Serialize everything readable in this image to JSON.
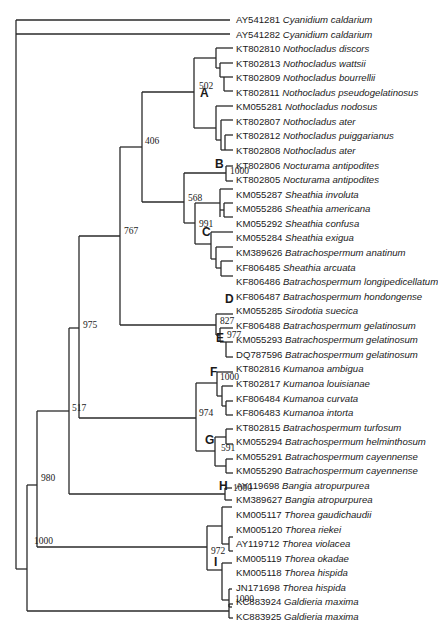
{
  "figure": {
    "type": "phylogenetic-tree",
    "leaf_start_y": 20,
    "leaf_spacing": 14.56,
    "leaf_x": 236
  },
  "leaves": [
    {
      "acc": "AY541281",
      "species": "Cyanidium caldarium",
      "tip_x": 236
    },
    {
      "acc": "AY541282",
      "species": "Cyanidium caldarium",
      "tip_x": 236
    },
    {
      "acc": "KT802810",
      "species": "Nothocladus discors",
      "tip_x": 236
    },
    {
      "acc": "KT802813",
      "species": "Nothocladus wattsii",
      "tip_x": 236
    },
    {
      "acc": "KT802809",
      "species": "Nothocladus bourrellii",
      "tip_x": 236
    },
    {
      "acc": "KT802811",
      "species": "Nothocladus pseudogelatinosus",
      "tip_x": 236
    },
    {
      "acc": "KM055281",
      "species": "Nothocladus nodosus",
      "tip_x": 236
    },
    {
      "acc": "KT802807",
      "species": "Nothocladus ater",
      "tip_x": 236
    },
    {
      "acc": "KT802812",
      "species": "Nothocladus puiggarianus",
      "tip_x": 236
    },
    {
      "acc": "KT802808",
      "species": "Nothocladus ater",
      "tip_x": 236
    },
    {
      "acc": "KT802806",
      "species": "Nocturama antipodites",
      "tip_x": 236
    },
    {
      "acc": "KT802805",
      "species": "Nocturama antipodites",
      "tip_x": 236
    },
    {
      "acc": "KM055287",
      "species": "Sheathia involuta",
      "tip_x": 236
    },
    {
      "acc": "KM055286",
      "species": "Sheathia americana",
      "tip_x": 236
    },
    {
      "acc": "KM055292",
      "species": "Sheathia confusa",
      "tip_x": 236
    },
    {
      "acc": "KM055284",
      "species": "Sheathia exigua",
      "tip_x": 236
    },
    {
      "acc": "KM389626",
      "species": "Batrachospermum anatinum",
      "tip_x": 236
    },
    {
      "acc": "KF806485",
      "species": "Sheathia arcuata",
      "tip_x": 236
    },
    {
      "acc": "KF806486",
      "species": "Batrachospermum longipedicellatum",
      "tip_x": 236
    },
    {
      "acc": "KF806487",
      "species": "Batrachospermum hondongense",
      "tip_x": 236
    },
    {
      "acc": "KM055285",
      "species": "Sirodotia suecica",
      "tip_x": 236
    },
    {
      "acc": "KF806488",
      "species": "Batrachospermum gelatinosum",
      "tip_x": 236
    },
    {
      "acc": "KM055293",
      "species": "Batrachospermum gelatinosum",
      "tip_x": 236
    },
    {
      "acc": "DQ787596",
      "species": "Batrachospermum gelatinosum",
      "tip_x": 236
    },
    {
      "acc": "KT802816",
      "species": "Kumanoa ambigua",
      "tip_x": 236
    },
    {
      "acc": "KT802817",
      "species": "Kumanoa louisianae",
      "tip_x": 236
    },
    {
      "acc": "KF806484",
      "species": "Kumanoa curvata",
      "tip_x": 236
    },
    {
      "acc": "KF806483",
      "species": "Kumanoa intorta",
      "tip_x": 236
    },
    {
      "acc": "KT802815",
      "species": "Batrachospermum turfosum",
      "tip_x": 236
    },
    {
      "acc": "KM055294",
      "species": "Batrachospermum helminthosum",
      "tip_x": 236
    },
    {
      "acc": "KM055291",
      "species": "Batrachospermum cayennense",
      "tip_x": 236
    },
    {
      "acc": "KM055290",
      "species": "Batrachospermum cayennense",
      "tip_x": 236
    },
    {
      "acc": "AY119698",
      "species": "Bangia atropurpurea",
      "tip_x": 236
    },
    {
      "acc": "KM389627",
      "species": "Bangia atropurpurea",
      "tip_x": 236
    },
    {
      "acc": "KM005117",
      "species": "Thorea gaudichaudii",
      "tip_x": 236
    },
    {
      "acc": "KM005120",
      "species": "Thorea riekei",
      "tip_x": 236
    },
    {
      "acc": "AY119712",
      "species": "Thorea violacea",
      "tip_x": 236
    },
    {
      "acc": "KM005119",
      "species": "Thorea okadae",
      "tip_x": 236
    },
    {
      "acc": "KM005118",
      "species": "Thorea hispida",
      "tip_x": 236
    },
    {
      "acc": "JN171698",
      "species": "Thorea hispida",
      "tip_x": 236
    },
    {
      "acc": "KC883924",
      "species": "Galdieria maxima",
      "tip_x": 236
    },
    {
      "acc": "KC883925",
      "species": "Galdieria maxima",
      "tip_x": 236
    }
  ],
  "bootstrap_labels": [
    {
      "value": "502",
      "x": 199,
      "y": 87
    },
    {
      "value": "406",
      "x": 145,
      "y": 142
    },
    {
      "value": "1000",
      "x": 230,
      "y": 172
    },
    {
      "value": "568",
      "x": 188,
      "y": 199
    },
    {
      "value": "991",
      "x": 199,
      "y": 225
    },
    {
      "value": "767",
      "x": 124,
      "y": 232
    },
    {
      "value": "827",
      "x": 220,
      "y": 322
    },
    {
      "value": "977",
      "x": 227,
      "y": 336
    },
    {
      "value": "975",
      "x": 83,
      "y": 326
    },
    {
      "value": "1000",
      "x": 220,
      "y": 378
    },
    {
      "value": "517",
      "x": 72,
      "y": 409
    },
    {
      "value": "974",
      "x": 199,
      "y": 414
    },
    {
      "value": "591",
      "x": 221,
      "y": 449
    },
    {
      "value": "1000",
      "x": 233,
      "y": 489
    },
    {
      "value": "980",
      "x": 41,
      "y": 479
    },
    {
      "value": "972",
      "x": 211,
      "y": 552
    },
    {
      "value": "1000",
      "x": 34,
      "y": 542
    },
    {
      "value": "1000",
      "x": 235,
      "y": 600
    }
  ],
  "clade_labels": [
    {
      "letter": "A",
      "x": 200,
      "y": 93
    },
    {
      "letter": "B",
      "x": 215,
      "y": 164
    },
    {
      "letter": "C",
      "x": 202,
      "y": 232
    },
    {
      "letter": "D",
      "x": 225,
      "y": 299
    },
    {
      "letter": "E",
      "x": 216,
      "y": 338
    },
    {
      "letter": "F",
      "x": 210,
      "y": 372
    },
    {
      "letter": "G",
      "x": 205,
      "y": 440
    },
    {
      "letter": "H",
      "x": 219,
      "y": 486
    },
    {
      "letter": "I",
      "x": 214,
      "y": 562
    }
  ],
  "branches": [
    [
      16,
      20,
      16,
      569
    ],
    [
      16,
      20,
      230,
      20
    ],
    [
      16,
      34,
      230,
      34
    ],
    [
      16,
      569,
      27,
      569
    ],
    [
      27,
      485,
      27,
      611
    ],
    [
      27,
      611,
      229,
      611
    ],
    [
      229,
      604,
      229,
      618
    ],
    [
      229,
      604,
      233,
      604
    ],
    [
      229,
      618,
      233,
      618
    ],
    [
      27,
      485,
      37,
      485
    ],
    [
      37,
      411,
      37,
      547
    ],
    [
      37,
      547,
      207,
      547
    ],
    [
      207,
      526,
      207,
      570
    ],
    [
      207,
      526,
      222,
      526
    ],
    [
      207,
      570,
      222,
      570
    ],
    [
      222,
      507,
      222,
      544
    ],
    [
      222,
      507,
      232,
      507
    ],
    [
      222,
      544,
      229,
      544
    ],
    [
      229,
      537,
      229,
      551
    ],
    [
      229,
      537,
      233,
      537
    ],
    [
      229,
      551,
      233,
      551
    ],
    [
      222,
      563,
      222,
      600
    ],
    [
      222,
      563,
      232,
      563
    ],
    [
      222,
      600,
      229,
      600
    ],
    [
      229,
      589,
      229,
      607
    ],
    [
      229,
      589,
      232,
      589
    ],
    [
      229,
      607,
      232,
      607
    ],
    [
      37,
      411,
      69,
      411
    ],
    [
      69,
      328,
      69,
      494
    ],
    [
      69,
      494,
      225,
      494
    ],
    [
      225,
      488,
      225,
      500
    ],
    [
      225,
      488,
      232,
      488
    ],
    [
      225,
      500,
      232,
      500
    ],
    [
      69,
      328,
      79,
      328
    ],
    [
      79,
      236,
      79,
      418
    ],
    [
      79,
      418,
      196,
      418
    ],
    [
      196,
      383,
      196,
      451
    ],
    [
      196,
      383,
      217,
      383
    ],
    [
      196,
      451,
      215,
      451
    ],
    [
      217,
      372,
      217,
      396
    ],
    [
      217,
      372,
      233,
      372
    ],
    [
      217,
      396,
      222,
      396
    ],
    [
      222,
      386,
      222,
      406
    ],
    [
      222,
      386,
      233,
      386
    ],
    [
      222,
      406,
      226,
      406
    ],
    [
      226,
      401,
      226,
      415
    ],
    [
      226,
      401,
      233,
      401
    ],
    [
      226,
      415,
      233,
      415
    ],
    [
      215,
      437,
      215,
      466
    ],
    [
      215,
      437,
      226,
      437
    ],
    [
      215,
      466,
      226,
      466
    ],
    [
      226,
      429,
      226,
      444
    ],
    [
      226,
      429,
      233,
      429
    ],
    [
      226,
      444,
      233,
      444
    ],
    [
      226,
      459,
      226,
      473
    ],
    [
      226,
      459,
      233,
      459
    ],
    [
      226,
      473,
      233,
      473
    ],
    [
      79,
      236,
      120,
      236
    ],
    [
      120,
      147,
      120,
      325
    ],
    [
      120,
      325,
      216,
      325
    ],
    [
      216,
      314,
      216,
      335
    ],
    [
      216,
      314,
      233,
      314
    ],
    [
      216,
      335,
      220,
      335
    ],
    [
      220,
      328,
      220,
      342
    ],
    [
      220,
      328,
      233,
      328
    ],
    [
      220,
      342,
      226,
      342
    ],
    [
      226,
      342,
      226,
      357
    ],
    [
      226,
      342,
      233,
      342
    ],
    [
      226,
      357,
      233,
      357
    ],
    [
      120,
      147,
      142,
      147
    ],
    [
      142,
      92,
      142,
      202
    ],
    [
      142,
      202,
      184,
      202
    ],
    [
      184,
      173,
      184,
      223
    ],
    [
      184,
      173,
      226,
      173
    ],
    [
      226,
      166,
      226,
      181
    ],
    [
      226,
      166,
      233,
      166
    ],
    [
      226,
      181,
      233,
      181
    ],
    [
      184,
      223,
      195,
      223
    ],
    [
      195,
      203,
      195,
      244
    ],
    [
      195,
      203,
      220,
      203
    ],
    [
      220,
      189,
      220,
      217
    ],
    [
      220,
      189,
      233,
      189
    ],
    [
      220,
      210,
      224,
      210
    ],
    [
      224,
      203,
      224,
      217
    ],
    [
      224,
      203,
      233,
      203
    ],
    [
      224,
      217,
      233,
      217
    ],
    [
      195,
      244,
      211,
      244
    ],
    [
      211,
      232,
      211,
      259
    ],
    [
      211,
      232,
      233,
      232
    ],
    [
      211,
      259,
      216,
      259
    ],
    [
      216,
      247,
      216,
      268
    ],
    [
      216,
      247,
      233,
      247
    ],
    [
      216,
      268,
      221,
      268
    ],
    [
      221,
      261,
      221,
      276
    ],
    [
      221,
      261,
      233,
      261
    ],
    [
      221,
      276,
      233,
      276
    ],
    [
      142,
      92,
      194,
      92
    ],
    [
      194,
      58,
      194,
      128
    ],
    [
      194,
      58,
      216,
      58
    ],
    [
      216,
      48,
      216,
      68
    ],
    [
      216,
      48,
      233,
      48
    ],
    [
      216,
      68,
      220,
      68
    ],
    [
      220,
      63,
      220,
      77
    ],
    [
      220,
      63,
      233,
      63
    ],
    [
      220,
      77,
      224,
      77
    ],
    [
      224,
      77,
      224,
      91
    ],
    [
      224,
      77,
      233,
      77
    ],
    [
      224,
      91,
      233,
      91
    ],
    [
      194,
      128,
      216,
      128
    ],
    [
      216,
      106,
      216,
      140
    ],
    [
      216,
      106,
      233,
      106
    ],
    [
      216,
      140,
      221,
      140
    ],
    [
      221,
      120,
      221,
      150
    ],
    [
      221,
      120,
      233,
      120
    ],
    [
      221,
      150,
      225,
      150
    ],
    [
      225,
      135,
      225,
      150
    ],
    [
      225,
      135,
      233,
      135
    ],
    [
      225,
      150,
      233,
      150
    ]
  ]
}
